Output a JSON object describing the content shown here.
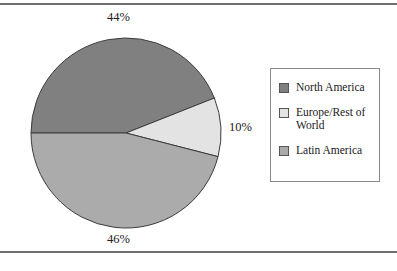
{
  "figure": {
    "background_color": "#ffffff",
    "rule_color": "#6e6e6e"
  },
  "chart_data": {
    "type": "pie",
    "title": "",
    "labels": [
      "North America",
      "Europe/Rest of World",
      "Latin America"
    ],
    "values": [
      44,
      10,
      46
    ],
    "value_labels": [
      "44%",
      "10%",
      "46%"
    ],
    "colors": [
      "#808080",
      "#e3e3e3",
      "#ababab"
    ],
    "start_angle_deg": 180,
    "direction": "clockwise",
    "slice_border_color": "#3c3c3c",
    "legend_position": "right",
    "grid": false
  },
  "pie": {
    "center_x": 96,
    "center_y": 96,
    "radius": 95,
    "slices": [
      {
        "name": "North America",
        "percent": 44,
        "color": "#808080"
      },
      {
        "name": "Europe/Rest of World",
        "percent": 10,
        "color": "#e3e3e3"
      },
      {
        "name": "Latin America",
        "percent": 46,
        "color": "#ababab"
      }
    ]
  },
  "callouts": {
    "top": "44%",
    "bottom": "46%",
    "right": "10%"
  },
  "legend": {
    "items": [
      {
        "label": "North America",
        "color": "#808080"
      },
      {
        "label": "Europe/Rest of World",
        "color": "#e3e3e3"
      },
      {
        "label": "Latin America",
        "color": "#ababab"
      }
    ]
  }
}
